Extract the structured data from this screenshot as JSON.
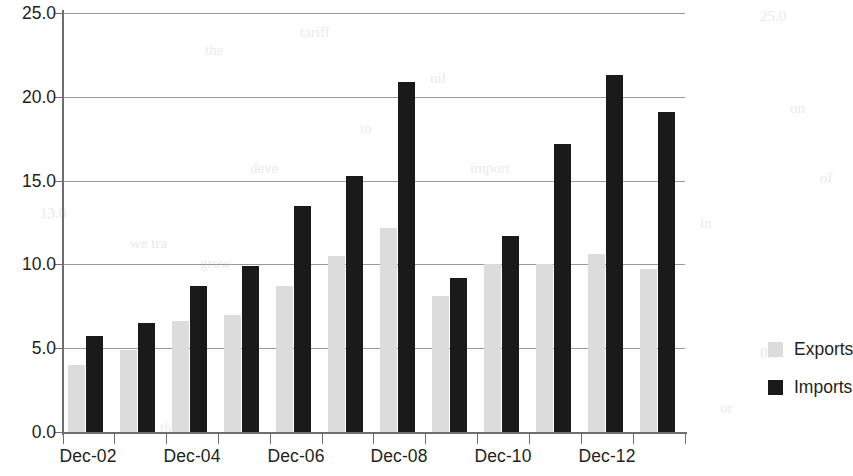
{
  "chart_data": {
    "type": "bar",
    "title": "",
    "subtitle": "",
    "xlabel": "",
    "ylabel": "",
    "ylim": [
      0.0,
      25.0
    ],
    "ytick_values": [
      0.0,
      5.0,
      10.0,
      15.0,
      20.0,
      25.0
    ],
    "ytick_labels": [
      "0.0",
      "5.0",
      "10.0",
      "15.0",
      "20.0",
      "25.0"
    ],
    "grid": true,
    "grid_axis": "y",
    "legend_position": "right",
    "categories": [
      "Dec-02",
      "Dec-03",
      "Dec-04",
      "Dec-05",
      "Dec-06",
      "Dec-07",
      "Dec-08",
      "Dec-09",
      "Dec-10",
      "Dec-11",
      "Dec-12",
      "Dec-13"
    ],
    "xtick_labels": [
      "Dec-02",
      "",
      "Dec-04",
      "",
      "Dec-06",
      "",
      "Dec-08",
      "",
      "Dec-10",
      "",
      "Dec-12",
      ""
    ],
    "series": [
      {
        "name": "Exports",
        "color": "#dcdcdc",
        "values": [
          4.0,
          4.9,
          6.6,
          7.0,
          8.7,
          10.5,
          12.2,
          8.1,
          10.0,
          10.0,
          10.6,
          9.7
        ]
      },
      {
        "name": "Imports",
        "color": "#1a1a1a",
        "values": [
          5.7,
          6.5,
          8.7,
          9.9,
          13.5,
          15.3,
          20.9,
          9.2,
          11.7,
          17.2,
          21.3,
          19.1
        ]
      }
    ]
  },
  "legend": {
    "items": [
      {
        "label": "Exports",
        "color": "#dcdcdc"
      },
      {
        "label": "Imports",
        "color": "#1a1a1a"
      }
    ]
  },
  "bleed_text": [
    {
      "text": "tariff",
      "x": 300,
      "y": 24
    },
    {
      "text": "25.0",
      "x": 760,
      "y": 8
    },
    {
      "text": "the",
      "x": 205,
      "y": 42
    },
    {
      "text": "nil",
      "x": 430,
      "y": 70
    },
    {
      "text": "to",
      "x": 360,
      "y": 120
    },
    {
      "text": "on",
      "x": 790,
      "y": 100
    },
    {
      "text": "deve",
      "x": 250,
      "y": 160
    },
    {
      "text": "import",
      "x": 470,
      "y": 160
    },
    {
      "text": "13.0",
      "x": 40,
      "y": 205
    },
    {
      "text": "we tra",
      "x": 130,
      "y": 235
    },
    {
      "text": "in",
      "x": 700,
      "y": 215
    },
    {
      "text": "of",
      "x": 820,
      "y": 170
    },
    {
      "text": "grow",
      "x": 200,
      "y": 255
    },
    {
      "text": "0.0",
      "x": 760,
      "y": 345
    },
    {
      "text": "or",
      "x": 720,
      "y": 400
    },
    {
      "text": "the",
      "x": 160,
      "y": 420
    }
  ]
}
